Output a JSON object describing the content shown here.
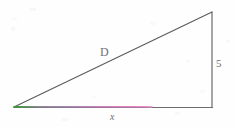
{
  "figure": {
    "type": "right-triangle-diagram",
    "background_color": "#fefefe",
    "stroke_color": "#5a5a5e",
    "labels": {
      "hypotenuse": "D",
      "vertical_side": "5",
      "base": "x"
    },
    "geometry": {
      "vertex_left": [
        14,
        107
      ],
      "vertex_bottom_right": [
        212,
        107
      ],
      "vertex_top_right": [
        212,
        12
      ],
      "right_angle_at": "bottom-right"
    },
    "base_highlight": {
      "description": "colored overlay on the base segment",
      "start_color": "#3aa83a",
      "mid_color": "#9a84a8",
      "end_color": "#e86fc0",
      "start_x": 14,
      "end_x": 150
    }
  }
}
